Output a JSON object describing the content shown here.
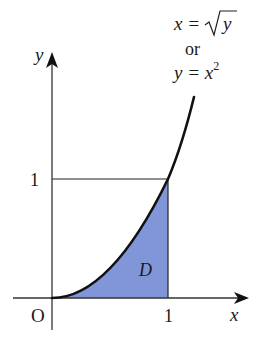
{
  "diagram": {
    "type": "region-under-curve",
    "axes": {
      "x_label": "x",
      "y_label": "y",
      "origin_label": "O",
      "x_tick_label": "1",
      "y_tick_label": "1"
    },
    "curve": {
      "equation_line1_lhs": "x = ",
      "equation_line1_rad": "y",
      "equation_or": "or",
      "equation_line2_lhs": "y = x",
      "equation_line2_exp": "2"
    },
    "region": {
      "label": "D",
      "fill_color": "#8096d8"
    },
    "colors": {
      "stroke": "#111111",
      "axis": "#333333"
    }
  }
}
